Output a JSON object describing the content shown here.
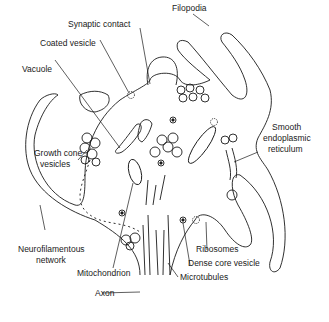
{
  "diagram": {
    "subject": "Growth cone",
    "labels": {
      "filopodia": "Filopodia",
      "synaptic_contact": "Synaptic contact",
      "coated_vesicle": "Coated vesicle",
      "vacuole": "Vacuole",
      "growth_cone_vesicles_1": "Growth cone",
      "growth_cone_vesicles_2": "vesicles",
      "smooth_er_1": "Smooth",
      "smooth_er_2": "endoplasmic",
      "smooth_er_3": "reticulum",
      "neurofilamentous_1": "Neurofilamentous",
      "neurofilamentous_2": "network",
      "ribosomes": "Ribosomes",
      "dense_core_vesicle": "Dense core vesicle",
      "mitochondrion": "Mitochondrion",
      "microtubules": "Microtubules",
      "axon": "Axon"
    },
    "colors": {
      "line": "#1a1a1a",
      "background": "#ffffff"
    }
  }
}
